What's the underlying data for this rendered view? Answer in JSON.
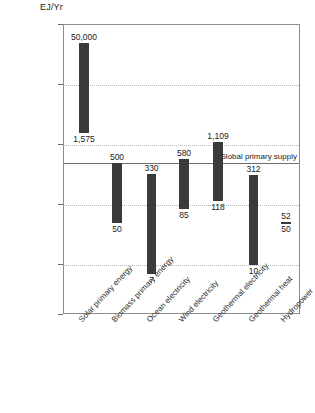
{
  "chart_data": {
    "type": "bar",
    "title": "",
    "subtitle": "",
    "xlabel": "",
    "ylabel": "EJ/Yr",
    "yscale": "log",
    "ylim": [
      1,
      100000
    ],
    "grid": true,
    "legend": null,
    "ytick_labels": [
      "100,000",
      "10,000",
      "1,000",
      "100",
      "10",
      "0"
    ],
    "ytick_values": [
      100000,
      10000,
      1000,
      100,
      10,
      0
    ],
    "categories": [
      "Solar primary energy",
      "Biomass primary energy",
      "Ocean electricity",
      "Wind electricity",
      "Geothermal electricity",
      "Geothermal heat",
      "Hydropower"
    ],
    "range_bars": [
      {
        "category": "Solar primary energy",
        "max": 50000,
        "min": 1575,
        "max_label": "50,000",
        "min_label": "1,575"
      },
      {
        "category": "Biomass primary energy",
        "max": 500,
        "min": 50,
        "max_label": "500",
        "min_label": "50"
      },
      {
        "category": "Ocean electricity",
        "max": 330,
        "min": 7,
        "max_label": "330",
        "min_label": "7"
      },
      {
        "category": "Wind electricity",
        "max": 580,
        "min": 85,
        "max_label": "580",
        "min_label": "85"
      },
      {
        "category": "Geothermal electricity",
        "max": 1109,
        "min": 118,
        "max_label": "1,109",
        "min_label": "118"
      },
      {
        "category": "Geothermal heat",
        "max": 312,
        "min": 10,
        "max_label": "312",
        "min_label": "10"
      },
      {
        "category": "Hydropower",
        "max": 52,
        "min": 50,
        "max_label": "52",
        "min_label": "50"
      }
    ],
    "annotations": [
      {
        "name": "global-primary-supply",
        "label": "Global primary supply",
        "value": 500,
        "type": "hline"
      }
    ],
    "colors": {
      "bar": "#3a3a3a",
      "grid": "#b9b9b9",
      "axis": "#8c8c8c",
      "supply_line": "#6e6e6e"
    }
  }
}
